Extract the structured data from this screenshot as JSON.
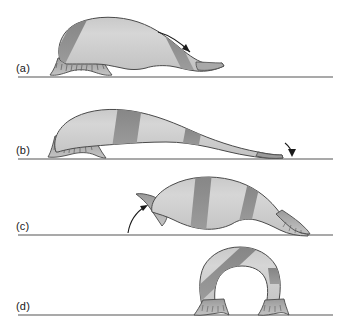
{
  "figure": {
    "type": "scientific-illustration",
    "background_color": "#ffffff",
    "panel_count": 4
  },
  "style": {
    "body_light": "#d2d2d2",
    "body_mid": "#bdbdbd",
    "body_dark": "#8f8f8f",
    "body_darker": "#7d7d7d",
    "outline": "#4a4a4a",
    "ground_color": "#8c8c8c",
    "arrow_color": "#1a1a1a",
    "label_color": "#1a1a1a",
    "gap_fill": "#ffffff"
  },
  "panels": [
    {
      "id": "a",
      "label": "(a)",
      "label_x": 16,
      "label_y": 62,
      "ground_y": 77,
      "ground_x1": 18,
      "ground_x2": 333,
      "arrow": "curved-arrow-down-right",
      "description": "body contracted, anterior raised, rear sucker attached"
    },
    {
      "id": "b",
      "label": "(b)",
      "label_x": 16,
      "label_y": 144,
      "ground_y": 159,
      "ground_x1": 18,
      "ground_x2": 333,
      "arrow": "short-arrow-down",
      "description": "body fully extended forward along substrate"
    },
    {
      "id": "c",
      "label": "(c)",
      "label_x": 16,
      "label_y": 220,
      "ground_y": 235,
      "ground_x1": 18,
      "ground_x2": 333,
      "arrow": "curved-arrow-up-right",
      "description": "anterior sucker attached, body beginning to arch"
    },
    {
      "id": "d",
      "label": "(d)",
      "label_x": 16,
      "label_y": 300,
      "ground_y": 315,
      "ground_x1": 18,
      "ground_x2": 333,
      "arrow": "none",
      "description": "body fully looped, both suckers attached close together"
    }
  ]
}
